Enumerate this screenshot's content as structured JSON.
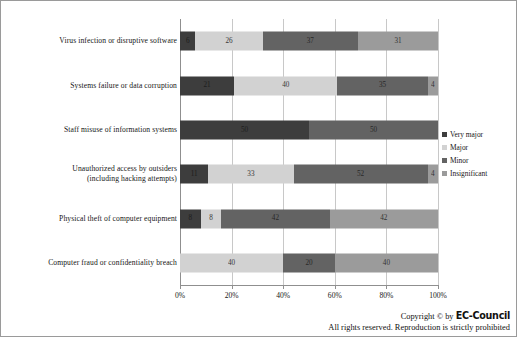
{
  "chart_data": {
    "type": "bar",
    "orientation": "horizontal",
    "stacked": "percent",
    "title": "",
    "xlabel": "",
    "ylabel": "",
    "xlim": [
      0,
      100
    ],
    "xticks": [
      "0%",
      "20%",
      "40%",
      "60%",
      "80%",
      "100%"
    ],
    "xtick_values": [
      0,
      20,
      40,
      60,
      80,
      100
    ],
    "grid": true,
    "legend_position": "right",
    "categories": [
      "Virus infection or disruptive software",
      "Systems failure or data corruption",
      "Staff misuse of information systems",
      "Unauthorized access by outsiders\n(including hacking attempts)",
      "Physical theft of computer equipment",
      "Computer fraud or confidentiality breach"
    ],
    "series": [
      {
        "name": "Very major",
        "color": "#3d3d3d",
        "values": [
          6,
          21,
          50,
          11,
          8,
          0
        ]
      },
      {
        "name": "Major",
        "color": "#d2d2d2",
        "values": [
          26,
          40,
          0,
          33,
          8,
          40
        ]
      },
      {
        "name": "Minor",
        "color": "#636363",
        "values": [
          37,
          35,
          50,
          52,
          42,
          20
        ]
      },
      {
        "name": "Insignificant",
        "color": "#9b9b9b",
        "values": [
          31,
          4,
          0,
          4,
          42,
          40
        ]
      }
    ]
  },
  "legend": {
    "items": [
      {
        "label": "Very major",
        "color": "#3d3d3d"
      },
      {
        "label": "Major",
        "color": "#d2d2d2"
      },
      {
        "label": "Minor",
        "color": "#636363"
      },
      {
        "label": "Insignificant",
        "color": "#9b9b9b"
      }
    ]
  },
  "footer": {
    "copyright_prefix": "Copyright © by ",
    "brand": "EC-Council",
    "rights": "All rights reserved. Reproduction is strictly prohibited"
  }
}
